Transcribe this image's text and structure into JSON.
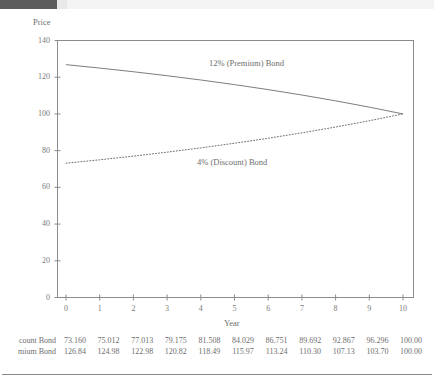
{
  "chart_data": {
    "type": "line",
    "title": "",
    "xlabel": "Year",
    "ylabel": "Price",
    "xlim": [
      0,
      10
    ],
    "ylim": [
      0,
      140
    ],
    "yticks": [
      0,
      20,
      40,
      60,
      80,
      100,
      120,
      140
    ],
    "xticks": [
      0,
      1,
      2,
      3,
      4,
      5,
      6,
      7,
      8,
      9,
      10
    ],
    "grid": false,
    "legend_position": "inline-annotations",
    "x": [
      0,
      1,
      2,
      3,
      4,
      5,
      6,
      7,
      8,
      9,
      10
    ],
    "series": [
      {
        "name": "12% (Premium) Bond",
        "style": "solid",
        "color": "#6e6e6e",
        "values": [
          126.84,
          124.98,
          122.98,
          120.82,
          118.49,
          115.97,
          113.24,
          110.3,
          107.13,
          103.7,
          100.0
        ]
      },
      {
        "name": "4% (Discount) Bond",
        "style": "dotted",
        "color": "#6e6e6e",
        "values": [
          73.16,
          75.012,
          77.013,
          79.175,
          81.508,
          84.029,
          86.751,
          89.692,
          92.867,
          96.296,
          100.0
        ]
      }
    ],
    "annotations": [
      {
        "text": "12% (Premium) Bond",
        "x": 5.2,
        "y": 129
      },
      {
        "text": "4% (Discount) Bond",
        "x": 4.8,
        "y": 82
      }
    ]
  },
  "axes": {
    "y_title": "Price",
    "x_title": "Year",
    "y_ticklabels": [
      "140",
      "120",
      "100",
      "80",
      "60",
      "40",
      "20",
      "0"
    ],
    "x_ticklabels": [
      "0",
      "1",
      "2",
      "3",
      "4",
      "5",
      "6",
      "7",
      "8",
      "9",
      "10"
    ]
  },
  "data_table": {
    "rows": [
      {
        "label": "count Bond",
        "values": [
          "73.160",
          "75.012",
          "77.013",
          "79.175",
          "81.508",
          "84.029",
          "86.751",
          "89.692",
          "92.867",
          "96.296",
          "100.00"
        ]
      },
      {
        "label": "mium Bond",
        "values": [
          "126.84",
          "124.98",
          "122.98",
          "120.82",
          "118.49",
          "115.97",
          "113.24",
          "110.30",
          "107.13",
          "103.70",
          "100.00"
        ]
      }
    ]
  },
  "decor": {
    "topbar_dark_color": "#5d5d5d",
    "topbar_light_color": "#f4f4f4",
    "rule_color": "#8a8a8a",
    "line_color": "#6e6e6e",
    "frame_color": "#8c8c8c"
  }
}
